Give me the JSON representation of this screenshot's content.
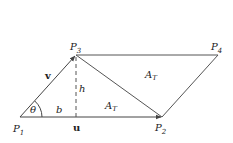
{
  "diagram": {
    "points": {
      "P1": {
        "label": "P",
        "sub": "1"
      },
      "P2": {
        "label": "P",
        "sub": "2"
      },
      "P3": {
        "label": "P",
        "sub": "3"
      },
      "P4": {
        "label": "P",
        "sub": "4"
      }
    },
    "vectors": {
      "u": "u",
      "v": "v"
    },
    "labels": {
      "theta": "θ",
      "b": "b",
      "h": "h",
      "area_upper": {
        "label": "A",
        "sub": "T"
      },
      "area_lower": {
        "label": "A",
        "sub": "T"
      }
    },
    "colors": {
      "stroke": "#444444",
      "text": "#222222"
    }
  }
}
